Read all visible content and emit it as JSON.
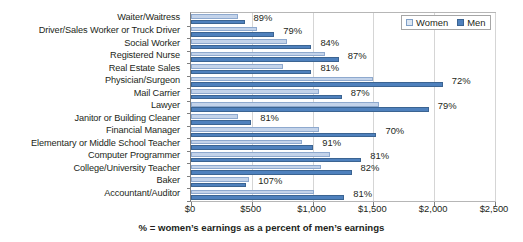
{
  "chart_data": {
    "type": "bar",
    "orientation": "horizontal",
    "title": "",
    "xlabel": "% = women’s earnings as a percent of men’s earnings",
    "ylabel": "",
    "xlim": [
      0,
      2500
    ],
    "xticks": [
      "$0",
      "$500",
      "$1,000",
      "$1,500",
      "$2,000",
      "$2,500"
    ],
    "xtick_values": [
      0,
      500,
      1000,
      1500,
      2000,
      2500
    ],
    "grid": true,
    "legend_position": "top-right",
    "legend": [
      "Women",
      "Men"
    ],
    "categories": [
      "Waiter/Waitress",
      "Driver/Sales Worker or Truck Driver",
      "Social Worker",
      "Registered Nurse",
      "Real Estate Sales",
      "Physician/Surgeon",
      "Mail Carrier",
      "Lawyer",
      "Janitor or Building Cleaner",
      "Financial Manager",
      "Elementary or Middle School Teacher",
      "Computer Programmer",
      "College/University Teacher",
      "Baker",
      "Accountant/Auditor"
    ],
    "series": [
      {
        "name": "Women",
        "color": "#c3d3ea",
        "values": [
          390,
          545,
          790,
          1105,
          760,
          1500,
          1055,
          1550,
          390,
          1055,
          915,
          1140,
          1070,
          480,
          1015
        ]
      },
      {
        "name": "Men",
        "color": "#4f81bd",
        "values": [
          440,
          685,
          990,
          1215,
          990,
          2070,
          1240,
          1955,
          495,
          1525,
          1005,
          1400,
          1320,
          450,
          1260
        ]
      }
    ],
    "annotations": [
      "89%",
      "79%",
      "84%",
      "87%",
      "81%",
      "72%",
      "87%",
      "79%",
      "81%",
      "70%",
      "91%",
      "81%",
      "82%",
      "107%",
      "81%"
    ]
  },
  "legend": {
    "women_label": "Women",
    "men_label": "Men"
  },
  "axis": {
    "title": "% = women’s earnings as a percent of men’s earnings"
  }
}
